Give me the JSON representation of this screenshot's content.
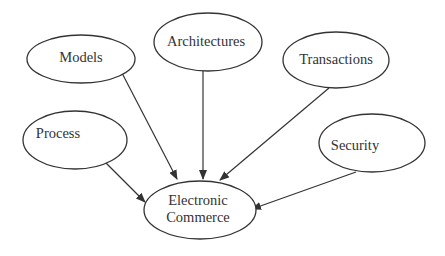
{
  "diagram": {
    "type": "concept-map",
    "colors": {
      "stroke": "#333333",
      "text": "#333333",
      "background": "#ffffff"
    },
    "nodes": [
      {
        "id": "models",
        "label": "Models",
        "cx": 81,
        "cy": 59,
        "rx": 54,
        "ry": 24,
        "tx": 81,
        "ty": 62
      },
      {
        "id": "architectures",
        "label": "Architectures",
        "cx": 208,
        "cy": 42,
        "rx": 54,
        "ry": 29,
        "tx": 206,
        "ty": 46
      },
      {
        "id": "transactions",
        "label": "Transactions",
        "cx": 336,
        "cy": 60,
        "rx": 53,
        "ry": 28,
        "tx": 336,
        "ty": 64
      },
      {
        "id": "process",
        "label": "Process",
        "cx": 75,
        "cy": 140,
        "rx": 52,
        "ry": 29,
        "tx": 58,
        "ty": 138
      },
      {
        "id": "security",
        "label": "Security",
        "cx": 372,
        "cy": 143,
        "rx": 53,
        "ry": 29,
        "tx": 355,
        "ty": 150
      },
      {
        "id": "ecommerce",
        "label_line1": "Electronic",
        "label_line2": "Commerce",
        "cx": 200,
        "cy": 210,
        "rx": 56,
        "ry": 29,
        "tx": 198,
        "ty1": 205,
        "ty2": 222
      }
    ],
    "edges": [
      {
        "from": "models",
        "to": "ecommerce",
        "x1": 123,
        "y1": 75,
        "x2": 177,
        "y2": 179
      },
      {
        "from": "architectures",
        "to": "ecommerce",
        "x1": 203,
        "y1": 71,
        "x2": 203,
        "y2": 179
      },
      {
        "from": "transactions",
        "to": "ecommerce",
        "x1": 329,
        "y1": 88,
        "x2": 220,
        "y2": 180
      },
      {
        "from": "process",
        "to": "ecommerce",
        "x1": 106,
        "y1": 163,
        "x2": 145,
        "y2": 202
      },
      {
        "from": "security",
        "to": "ecommerce",
        "x1": 356,
        "y1": 172,
        "x2": 252,
        "y2": 209
      }
    ]
  }
}
